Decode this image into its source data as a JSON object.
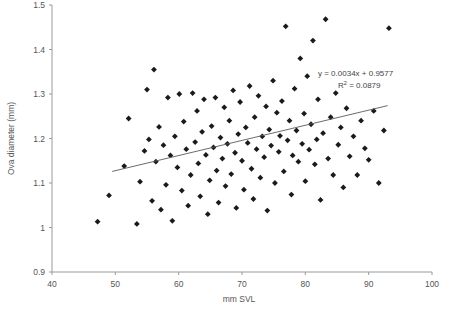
{
  "chart_data": {
    "type": "scatter",
    "title": "",
    "xlabel": "mm SVL",
    "ylabel": "Ova diameter (mm)",
    "xlim": [
      40,
      100
    ],
    "ylim": [
      0.9,
      1.5
    ],
    "xticks": [
      40,
      50,
      60,
      70,
      80,
      90,
      100
    ],
    "xtick_labels": [
      "40",
      "50",
      "60",
      "70",
      "80",
      "90",
      "100"
    ],
    "yticks": [
      0.9,
      1.0,
      1.1,
      1.2,
      1.3,
      1.4,
      1.5
    ],
    "ytick_labels": [
      "0.9",
      "1",
      "1.1",
      "1.2",
      "1.3",
      "1.4",
      "1.5"
    ],
    "grid": false,
    "legend": false,
    "marker": "diamond",
    "marker_color": "#1a1a1a",
    "annotations": [
      {
        "name": "regression-equation",
        "text": "y = 0.0034x + 0.9577"
      },
      {
        "name": "r-squared",
        "text_prefix": "R",
        "text_sup": "2",
        "text_suffix": " = 0.0879"
      }
    ],
    "trendline": {
      "type": "linear",
      "slope": 0.0034,
      "intercept": 0.9577,
      "r_squared": 0.0879,
      "x_start": 49.5,
      "x_end": 93.0
    },
    "series": [
      {
        "name": "Ova diameter vs SVL",
        "points": [
          [
            47.2,
            1.013
          ],
          [
            49.0,
            1.072
          ],
          [
            51.4,
            1.138
          ],
          [
            52.1,
            1.245
          ],
          [
            53.4,
            1.008
          ],
          [
            53.9,
            1.103
          ],
          [
            54.6,
            1.172
          ],
          [
            55.0,
            1.31
          ],
          [
            55.3,
            1.198
          ],
          [
            55.8,
            1.06
          ],
          [
            56.1,
            1.355
          ],
          [
            56.4,
            1.148
          ],
          [
            56.9,
            1.226
          ],
          [
            57.2,
            1.04
          ],
          [
            57.6,
            1.185
          ],
          [
            58.0,
            1.096
          ],
          [
            58.3,
            1.292
          ],
          [
            58.7,
            1.162
          ],
          [
            59.0,
            1.015
          ],
          [
            59.4,
            1.205
          ],
          [
            59.8,
            1.135
          ],
          [
            60.1,
            1.3
          ],
          [
            60.5,
            1.083
          ],
          [
            60.8,
            1.238
          ],
          [
            61.2,
            1.176
          ],
          [
            61.5,
            1.049
          ],
          [
            61.9,
            1.118
          ],
          [
            62.2,
            1.302
          ],
          [
            62.6,
            1.192
          ],
          [
            62.9,
            1.262
          ],
          [
            63.1,
            1.144
          ],
          [
            63.4,
            1.07
          ],
          [
            63.7,
            1.215
          ],
          [
            64.0,
            1.288
          ],
          [
            64.3,
            1.163
          ],
          [
            64.6,
            1.03
          ],
          [
            64.9,
            1.106
          ],
          [
            65.2,
            1.228
          ],
          [
            65.5,
            1.18
          ],
          [
            65.8,
            1.292
          ],
          [
            66.0,
            1.128
          ],
          [
            66.3,
            1.056
          ],
          [
            66.6,
            1.202
          ],
          [
            66.9,
            1.155
          ],
          [
            67.2,
            1.27
          ],
          [
            67.4,
            1.093
          ],
          [
            67.7,
            1.188
          ],
          [
            68.0,
            1.24
          ],
          [
            68.3,
            1.12
          ],
          [
            68.6,
            1.308
          ],
          [
            68.9,
            1.168
          ],
          [
            69.1,
            1.044
          ],
          [
            69.4,
            1.21
          ],
          [
            69.7,
            1.282
          ],
          [
            70.0,
            1.15
          ],
          [
            70.3,
            1.085
          ],
          [
            70.6,
            1.225
          ],
          [
            70.9,
            1.19
          ],
          [
            71.2,
            1.318
          ],
          [
            71.5,
            1.132
          ],
          [
            71.8,
            1.064
          ],
          [
            72.0,
            1.248
          ],
          [
            72.3,
            1.176
          ],
          [
            72.6,
            1.296
          ],
          [
            72.9,
            1.112
          ],
          [
            73.2,
            1.205
          ],
          [
            73.5,
            1.158
          ],
          [
            73.8,
            1.272
          ],
          [
            74.0,
            1.038
          ],
          [
            74.3,
            1.22
          ],
          [
            74.6,
            1.184
          ],
          [
            74.9,
            1.33
          ],
          [
            75.2,
            1.1
          ],
          [
            75.5,
            1.258
          ],
          [
            75.8,
            1.17
          ],
          [
            76.0,
            1.206
          ],
          [
            76.3,
            1.284
          ],
          [
            76.6,
            1.126
          ],
          [
            76.9,
            1.452
          ],
          [
            77.2,
            1.196
          ],
          [
            77.5,
            1.24
          ],
          [
            77.8,
            1.074
          ],
          [
            78.0,
            1.162
          ],
          [
            78.3,
            1.312
          ],
          [
            78.6,
            1.218
          ],
          [
            78.9,
            1.148
          ],
          [
            79.2,
            1.38
          ],
          [
            79.5,
            1.188
          ],
          [
            79.8,
            1.256
          ],
          [
            80.0,
            1.104
          ],
          [
            80.3,
            1.34
          ],
          [
            80.6,
            1.175
          ],
          [
            80.9,
            1.232
          ],
          [
            81.2,
            1.42
          ],
          [
            81.5,
            1.142
          ],
          [
            81.8,
            1.198
          ],
          [
            82.0,
            1.288
          ],
          [
            82.4,
            1.062
          ],
          [
            82.8,
            1.212
          ],
          [
            83.2,
            1.468
          ],
          [
            83.6,
            1.155
          ],
          [
            84.0,
            1.248
          ],
          [
            84.4,
            1.118
          ],
          [
            84.8,
            1.302
          ],
          [
            85.2,
            1.186
          ],
          [
            85.6,
            1.225
          ],
          [
            86.0,
            1.09
          ],
          [
            86.5,
            1.268
          ],
          [
            87.0,
            1.16
          ],
          [
            87.6,
            1.205
          ],
          [
            88.2,
            1.118
          ],
          [
            88.8,
            1.24
          ],
          [
            89.4,
            1.178
          ],
          [
            90.0,
            1.152
          ],
          [
            90.8,
            1.262
          ],
          [
            91.6,
            1.1
          ],
          [
            92.4,
            1.218
          ],
          [
            93.2,
            1.448
          ]
        ]
      }
    ]
  }
}
